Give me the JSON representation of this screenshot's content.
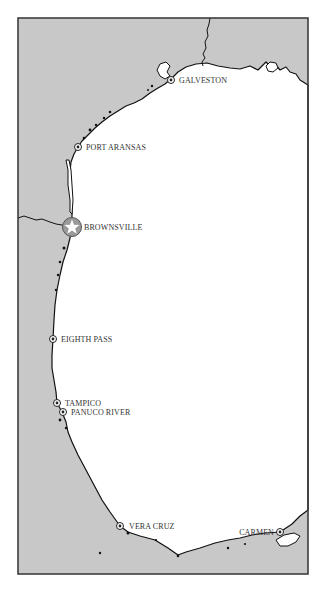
{
  "map": {
    "colors": {
      "land": "#c8c8c8",
      "water": "#ffffff",
      "coastline": "#111111",
      "frame": "#333333",
      "label": "#333333"
    },
    "cities": [
      {
        "id": "galveston",
        "name": "GALVESTON",
        "x": 171,
        "y": 80,
        "marker": "circle-dot"
      },
      {
        "id": "port-aransas",
        "name": "PORT ARANSAS",
        "x": 78,
        "y": 147,
        "marker": "circle-dot"
      },
      {
        "id": "brownsville",
        "name": "BROWNSVILLE",
        "x": 72,
        "y": 227,
        "marker": "star-circle"
      },
      {
        "id": "eighth-pass",
        "name": "EIGHTH PASS",
        "x": 53,
        "y": 339,
        "marker": "circle-dot"
      },
      {
        "id": "tampico",
        "name": "TAMPICO",
        "x": 57,
        "y": 403,
        "marker": "circle-dot"
      },
      {
        "id": "panuco-river",
        "name": "PANUCO RIVER",
        "x": 63,
        "y": 412,
        "marker": "circle-dot"
      },
      {
        "id": "vera-cruz",
        "name": "VERA CRUZ",
        "x": 120,
        "y": 526,
        "marker": "circle-dot"
      },
      {
        "id": "carmen",
        "name": "CARMEN",
        "x": 280,
        "y": 532,
        "marker": "circle-dot"
      }
    ]
  }
}
